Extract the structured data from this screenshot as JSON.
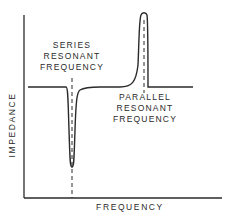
{
  "diagram": {
    "title": "",
    "labels": {
      "series": [
        "SERIES",
        "RESONANT",
        "FREQUENCY"
      ],
      "parallel": [
        "PARALLEL",
        "RESONANT",
        "FREQUENCY"
      ],
      "x_axis": "FREQUENCY",
      "y_axis": "IMPEDANCE"
    },
    "features": {
      "series_resonance": "minimum impedance dip",
      "parallel_resonance": "maximum impedance peak"
    },
    "colors": {
      "line": "#2a2a2a",
      "background": "#ffffff"
    }
  }
}
